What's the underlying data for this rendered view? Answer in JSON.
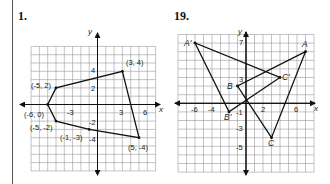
{
  "problems": [
    {
      "number": "1.",
      "axes": {
        "x_label": "x",
        "y_label": "y"
      },
      "x_ticks": [
        "-3",
        "3",
        "6"
      ],
      "y_ticks": [
        "4",
        "2",
        "-2",
        "-4"
      ],
      "point_labels": [
        "(3, 4)",
        "(-5, 2)",
        "(-6, 0)",
        "(-5, -2)",
        "(-1, -3)",
        "(5, -4)"
      ],
      "polygon": [
        [
          3,
          4
        ],
        [
          5,
          -4
        ],
        [
          -1,
          -3
        ],
        [
          -5,
          -2
        ],
        [
          -6,
          0
        ],
        [
          -5,
          2
        ]
      ]
    },
    {
      "number": "19.",
      "axes": {
        "x_label": "x",
        "y_label": "y"
      },
      "x_ticks": [
        "-6",
        "-4",
        "2",
        "6"
      ],
      "y_ticks": [
        "7",
        "3",
        "-1",
        "-3",
        "-5"
      ],
      "point_labels": [
        "A'",
        "A",
        "B",
        "C'",
        "B'",
        "C"
      ],
      "triangle_ABC": {
        "A": [
          7,
          6
        ],
        "B": [
          -1,
          2
        ],
        "C": [
          3,
          -4
        ]
      },
      "triangle_A1B1C1": {
        "A'": [
          -6,
          7
        ],
        "B'": [
          -2,
          -1
        ],
        "C'": [
          4,
          3
        ]
      }
    }
  ],
  "chart_data": [
    {
      "type": "scatter",
      "title": "1.",
      "xlabel": "x",
      "ylabel": "y",
      "xlim": [
        -8,
        7
      ],
      "ylim": [
        -8,
        7
      ],
      "grid": true,
      "series": [
        {
          "name": "polygon",
          "closed": true,
          "points": [
            [
              3,
              4
            ],
            [
              5,
              -4
            ],
            [
              -1,
              -3
            ],
            [
              -5,
              -2
            ],
            [
              -6,
              0
            ],
            [
              -5,
              2
            ]
          ]
        }
      ],
      "annotations": [
        "(3, 4)",
        "(-5, 2)",
        "(-6, 0)",
        "(-5, -2)",
        "(-1, -3)",
        "(5, -4)"
      ]
    },
    {
      "type": "scatter",
      "title": "19.",
      "xlabel": "x",
      "ylabel": "y",
      "xlim": [
        -8,
        8
      ],
      "ylim": [
        -8,
        8
      ],
      "grid": true,
      "series": [
        {
          "name": "ABC",
          "closed": true,
          "points": [
            [
              7,
              6
            ],
            [
              -1,
              2
            ],
            [
              3,
              -4
            ]
          ],
          "labels": [
            "A",
            "B",
            "C"
          ]
        },
        {
          "name": "A'B'C'",
          "closed": true,
          "points": [
            [
              -6,
              7
            ],
            [
              -2,
              -1
            ],
            [
              4,
              3
            ]
          ],
          "labels": [
            "A'",
            "B'",
            "C'"
          ]
        }
      ]
    }
  ]
}
